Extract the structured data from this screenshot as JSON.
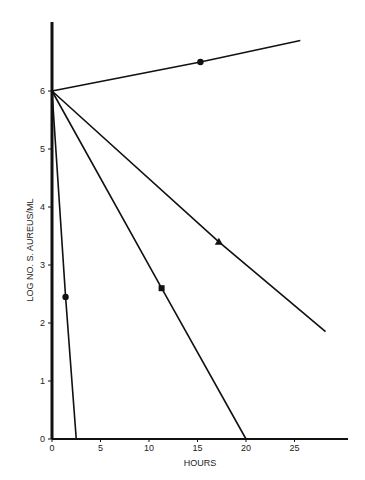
{
  "chart_data": {
    "type": "line",
    "title": "",
    "xlabel": "HOURS",
    "ylabel": "LOG NO. S. AUREUS/ML",
    "xlim": [
      0,
      30
    ],
    "ylim": [
      0,
      7
    ],
    "x_ticks": [
      "0",
      "5",
      "10",
      "15",
      "20",
      "25"
    ],
    "y_ticks": [
      "0",
      "1",
      "2",
      "3",
      "4",
      "5",
      "6"
    ],
    "grid": false,
    "legend": null,
    "series": [
      {
        "name": "growth (circle, rising)",
        "marker": "circle",
        "x": [
          0,
          15.3,
          25.6
        ],
        "y": [
          6.0,
          6.5,
          6.87
        ]
      },
      {
        "name": "triangle",
        "marker": "triangle",
        "x": [
          0,
          17.2,
          28.2
        ],
        "y": [
          6.0,
          3.4,
          1.85
        ]
      },
      {
        "name": "square",
        "marker": "square",
        "x": [
          0,
          11.3,
          20.0
        ],
        "y": [
          6.0,
          2.6,
          0.0
        ]
      },
      {
        "name": "circle, rapid kill",
        "marker": "circle",
        "x": [
          0,
          1.4,
          2.5
        ],
        "y": [
          6.0,
          2.45,
          0.0
        ]
      }
    ]
  },
  "axis": {
    "xlabel": "HOURS",
    "ylabel": "LOG NO. S. AUREUS/ML"
  }
}
